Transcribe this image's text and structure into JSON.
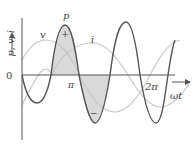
{
  "diagram": {
    "y_axis_label": "p, v, i",
    "x_axis_label": "ωt",
    "origin_label": "0",
    "tick_labels": [
      "π",
      "2π"
    ],
    "curves": [
      {
        "name": "p",
        "label": "p",
        "color": "#555555",
        "description": "instantaneous power, double frequency"
      },
      {
        "name": "v",
        "label": "v",
        "color": "#c8c8c8",
        "description": "voltage"
      },
      {
        "name": "i",
        "label": "i",
        "color": "#c8c8c8",
        "description": "current, lagging voltage"
      }
    ],
    "region_signs": [
      "+",
      "−"
    ],
    "colors": {
      "axis": "#555555",
      "fill": "#d9d9d9",
      "text": "#444444"
    }
  }
}
